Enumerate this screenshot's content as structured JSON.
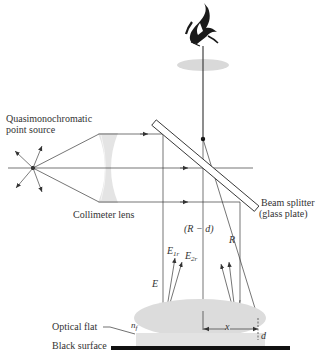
{
  "diagram": {
    "type": "optical-setup",
    "labels": {
      "source_line1": "Quasimonochromatic",
      "source_line2": "point source",
      "lens": "Collimeter lens",
      "splitter_line1": "Beam splitter",
      "splitter_line2": "(glass plate)",
      "r_minus_d": "(R − d)",
      "r": "R",
      "e": "E",
      "e1r_main": "E",
      "e1r_sub": "1r",
      "e2r_main": "E",
      "e2r_sub": "2r",
      "x": "x",
      "d": "d",
      "nf_main": "n",
      "nf_sub": "f",
      "optical_flat": "Optical flat",
      "black_surface": "Black surface"
    },
    "components": [
      {
        "name": "point-source",
        "label": "Quasimonochromatic point source"
      },
      {
        "name": "collimeter-lens",
        "label": "Collimeter lens"
      },
      {
        "name": "beam-splitter",
        "label": "Beam splitter (glass plate)"
      },
      {
        "name": "optical-flat",
        "label": "Optical flat",
        "index": "n_f"
      },
      {
        "name": "black-surface",
        "label": "Black surface"
      },
      {
        "name": "eye",
        "label": ""
      }
    ],
    "colors": {
      "line": "#3a3a3a",
      "lens_fill": "#e4e4e4",
      "ellipse_fill": "#dcdcdc",
      "surface": "#111111"
    }
  }
}
